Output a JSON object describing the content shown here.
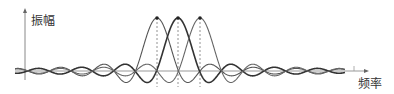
{
  "diagram": {
    "title": "",
    "y_axis_label": "振幅",
    "x_axis_label": "频率",
    "colors": {
      "axis": "#888888",
      "curve_1": "#555555",
      "curve_2": "#333333",
      "curve_3": "#666666",
      "dashed": "#777777",
      "peak_dot": "#222222"
    }
  },
  "chart_data": {
    "type": "line",
    "title": "",
    "xlabel": "频率",
    "ylabel": "振幅",
    "series": [
      {
        "name": "subcarrier 1",
        "function": "sinc",
        "center": 157,
        "peak": 1.0
      },
      {
        "name": "subcarrier 2",
        "function": "sinc",
        "center": 178,
        "peak": 1.0
      },
      {
        "name": "subcarrier 3",
        "function": "sinc",
        "center": 200,
        "peak": 1.0
      }
    ],
    "spacing_px": 21.5,
    "grid": false,
    "legend": "none"
  }
}
